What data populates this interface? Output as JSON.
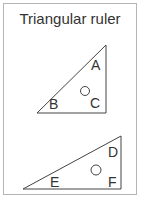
{
  "title": "Triangular ruler",
  "triangles": [
    {
      "labels": {
        "A": "A",
        "B": "B",
        "C": "C"
      }
    },
    {
      "labels": {
        "D": "D",
        "E": "E",
        "F": "F"
      }
    }
  ]
}
